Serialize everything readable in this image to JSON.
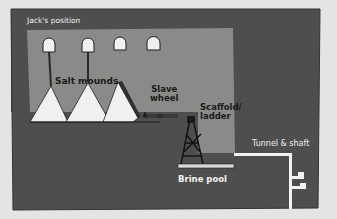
{
  "diagram": {
    "labels": {
      "jacks_position": "Jack's position",
      "salt_mounds": "Salt mounds",
      "slave_wheel_line1": "Slave",
      "slave_wheel_line2": "wheel",
      "scaffold_line1": "Scaffold/",
      "scaffold_line2": "ladder",
      "brine_pool": "Brine pool",
      "tunnel_shaft": "Tunnel & shaft"
    },
    "colors": {
      "background": "#e4e4e2",
      "outer_rock": "#4e4e4e",
      "cavern": "#8a8a88",
      "salt": "#f0f0ee",
      "outline": "#1e1e1e",
      "tunnel": "#f2f2f0"
    },
    "elements": [
      "ceiling-openings",
      "hanging-ropes",
      "salt-mounds",
      "slave-wheel",
      "scaffold-ladder",
      "brine-pool",
      "tunnel-and-shaft"
    ]
  }
}
